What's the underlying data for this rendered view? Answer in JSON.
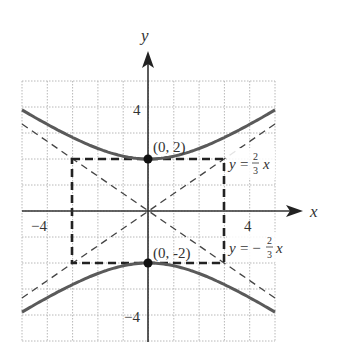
{
  "chart_data": {
    "type": "line",
    "title": "",
    "xlabel": "x",
    "ylabel": "y",
    "xlim": [
      -5,
      5
    ],
    "ylim": [
      -5,
      5
    ],
    "grid": true,
    "grid_step": 1,
    "x_tick_labels": [
      {
        "value": -4,
        "label": "−4"
      },
      {
        "value": 4,
        "label": "4"
      }
    ],
    "y_tick_labels": [
      {
        "value": 4,
        "label": "4"
      },
      {
        "value": -4,
        "label": "−4"
      }
    ],
    "series": [
      {
        "name": "hyperbola-upper-branch",
        "equation": "y^2/4 - x^2/9 = 1 (y > 0)",
        "style": "solid",
        "x": [
          -5,
          -4,
          -3,
          -2,
          -1,
          0,
          1,
          2,
          3,
          4,
          5
        ],
        "y": [
          3.89,
          3.33,
          2.83,
          2.4,
          2.11,
          2.0,
          2.11,
          2.4,
          2.83,
          3.33,
          3.89
        ]
      },
      {
        "name": "hyperbola-lower-branch",
        "equation": "y^2/4 - x^2/9 = 1 (y < 0)",
        "style": "solid",
        "x": [
          -5,
          -4,
          -3,
          -2,
          -1,
          0,
          1,
          2,
          3,
          4,
          5
        ],
        "y": [
          -3.89,
          -3.33,
          -2.83,
          -2.4,
          -2.11,
          -2.0,
          -2.11,
          -2.4,
          -2.83,
          -3.33,
          -3.89
        ]
      },
      {
        "name": "asymptote-positive",
        "equation": "y = 2/3 x",
        "style": "dashed",
        "x": [
          -5,
          5
        ],
        "y": [
          -3.33,
          3.33
        ]
      },
      {
        "name": "asymptote-negative",
        "equation": "y = -2/3 x",
        "style": "dashed",
        "x": [
          -5,
          5
        ],
        "y": [
          3.33,
          -3.33
        ]
      },
      {
        "name": "fundamental-rectangle",
        "style": "bold-dashed",
        "x": [
          -3,
          3,
          3,
          -3,
          -3
        ],
        "y": [
          2,
          2,
          -2,
          -2,
          2
        ]
      }
    ],
    "points": [
      {
        "x": 0,
        "y": 2,
        "label": "(0, 2)"
      },
      {
        "x": 0,
        "y": -2,
        "label": "(0, -2)"
      }
    ],
    "annotations": [
      {
        "text_prefix": "y = ",
        "frac_num": "2",
        "frac_den": "3",
        "suffix": "x",
        "sign": ""
      },
      {
        "text_prefix": "y = −",
        "frac_num": "2",
        "frac_den": "3",
        "suffix": "x",
        "sign": "-"
      }
    ]
  },
  "labels": {
    "x_axis": "x",
    "y_axis": "y",
    "tick_x_neg4": "−4",
    "tick_x_pos4": "4",
    "tick_y_pos4": "4",
    "tick_y_neg4": "−4",
    "vertex_top": "(0, 2)",
    "vertex_bottom": "(0, -2)",
    "asym_pos_y": "y",
    "asym_pos_eq": "=",
    "asym_pos_num": "2",
    "asym_pos_den": "3",
    "asym_pos_x": "x",
    "asym_neg_y": "y",
    "asym_neg_eq": "= −",
    "asym_neg_num": "2",
    "asym_neg_den": "3",
    "asym_neg_x": "x"
  },
  "colors": {
    "curve": "#5a5a5a",
    "axis": "#333333",
    "grid": "#b8b8b8",
    "dashed": "#444444",
    "rectangle": "#222222",
    "point": "#111111"
  }
}
